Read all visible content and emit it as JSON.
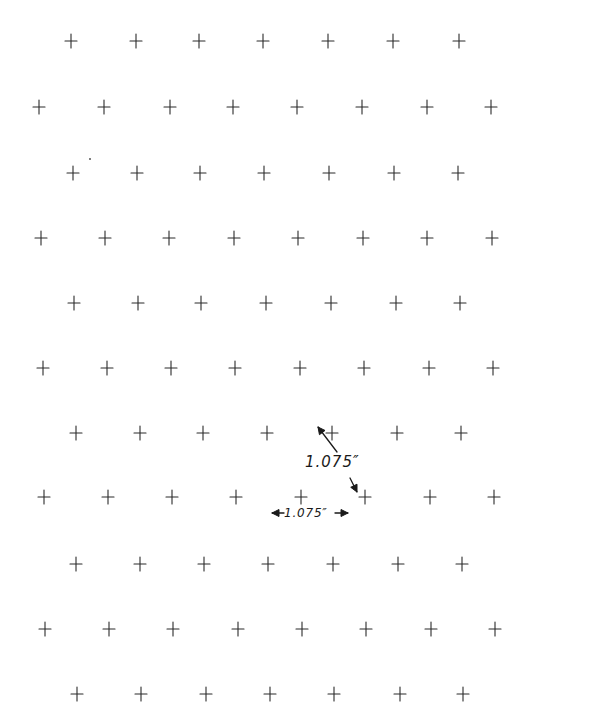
{
  "diagram": {
    "type": "staggered-hexagonal-cross-grid",
    "background": "#ffffff",
    "mark_color": "#2a2a2a",
    "mark_glyph": "plus-cross",
    "cross_half_size_px": 6,
    "rows": [
      {
        "y": 41,
        "xs": [
          71,
          136,
          199,
          263,
          328,
          393,
          459
        ]
      },
      {
        "y": 107,
        "xs": [
          39,
          104,
          170,
          233,
          297,
          362,
          427,
          491
        ]
      },
      {
        "y": 173,
        "xs": [
          73,
          137,
          200,
          264,
          329,
          394,
          458
        ]
      },
      {
        "y": 238,
        "xs": [
          41,
          105,
          169,
          234,
          298,
          363,
          427,
          492
        ]
      },
      {
        "y": 303,
        "xs": [
          74,
          138,
          201,
          266,
          331,
          396,
          460
        ]
      },
      {
        "y": 368,
        "xs": [
          43,
          107,
          171,
          235,
          300,
          364,
          429,
          493
        ]
      },
      {
        "y": 433,
        "xs": [
          76,
          140,
          203,
          267,
          332,
          397,
          461
        ]
      },
      {
        "y": 497,
        "xs": [
          44,
          108,
          172,
          236,
          301,
          365,
          430,
          494
        ]
      },
      {
        "y": 564,
        "xs": [
          76,
          140,
          204,
          268,
          333,
          398,
          462
        ]
      },
      {
        "y": 629,
        "xs": [
          45,
          109,
          173,
          238,
          302,
          366,
          431,
          495
        ]
      },
      {
        "y": 694,
        "xs": [
          77,
          141,
          206,
          270,
          334,
          400,
          463
        ]
      }
    ],
    "stray_marks": [
      {
        "x": 90,
        "y": 159
      }
    ],
    "annotations": {
      "diagonal_spacing": {
        "label": "1.075″",
        "arrow_up": {
          "from": [
            337,
            452
          ],
          "to": [
            318,
            427
          ]
        },
        "arrow_down": {
          "from": [
            350,
            478
          ],
          "to": [
            357,
            492
          ]
        }
      },
      "horizontal_spacing": {
        "label": "1.075″",
        "arrow_left": {
          "from": [
            284,
            513
          ],
          "to": [
            272,
            513
          ]
        },
        "arrow_right": {
          "from": [
            335,
            513
          ],
          "to": [
            348,
            513
          ]
        }
      }
    }
  }
}
